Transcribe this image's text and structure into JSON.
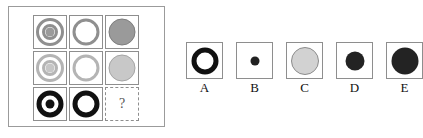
{
  "puzzle": {
    "type": "visual-analogy-matrix",
    "question_mark": "?",
    "matrix": {
      "rows": 3,
      "cols": 3,
      "cells": [
        {
          "id": "r1c1",
          "figure": "concentric-rings",
          "description": "gray concentric rings with gray center dot",
          "outer_ring_color": "#8f8f8f",
          "inner_ring_color": "#8f8f8f",
          "core_color": "#9a9a9a",
          "gap_color": "#ffffff",
          "outer_diameter": 28,
          "ring_thickness": 3,
          "inner_diameter": 16,
          "core_diameter": 9
        },
        {
          "id": "r1c2",
          "figure": "single-ring",
          "description": "gray open ring with white center",
          "ring_color": "#8f8f8f",
          "core_color": "#ffffff",
          "outer_diameter": 27,
          "ring_thickness": 3
        },
        {
          "id": "r1c3",
          "figure": "solid-disc",
          "description": "solid medium gray disc",
          "fill_color": "#9a9a9a",
          "stroke_color": "#7d7d7d",
          "diameter": 27
        },
        {
          "id": "r2c1",
          "figure": "concentric-rings",
          "description": "light gray concentric rings with light gray center dot",
          "outer_ring_color": "#b4b4b4",
          "inner_ring_color": "#b4b4b4",
          "core_color": "#c6c6c6",
          "gap_color": "#ffffff",
          "outer_diameter": 28,
          "ring_thickness": 3,
          "inner_diameter": 16,
          "core_diameter": 9
        },
        {
          "id": "r2c2",
          "figure": "single-ring",
          "description": "light gray open ring with white center",
          "ring_color": "#b4b4b4",
          "core_color": "#ffffff",
          "outer_diameter": 27,
          "ring_thickness": 3
        },
        {
          "id": "r2c3",
          "figure": "solid-disc",
          "description": "solid light gray disc",
          "fill_color": "#c8c8c8",
          "stroke_color": "#a5a5a5",
          "diameter": 27
        },
        {
          "id": "r3c1",
          "figure": "concentric-rings",
          "description": "thick black ring with white gap and black core",
          "outer_ring_color": "#111111",
          "inner_ring_color": "#111111",
          "core_color": "#111111",
          "gap_color": "#ffffff",
          "outer_diameter": 27,
          "ring_thickness": 5,
          "inner_diameter": 12,
          "core_diameter": 9
        },
        {
          "id": "r3c2",
          "figure": "single-ring",
          "description": "thick black open ring with white center",
          "ring_color": "#111111",
          "core_color": "#ffffff",
          "outer_diameter": 27,
          "ring_thickness": 5
        },
        {
          "id": "r3c3",
          "figure": "missing",
          "description": "dashed empty cell containing a question mark",
          "label": "?"
        }
      ]
    },
    "options": [
      {
        "label": "A",
        "figure": "thick-ring",
        "description": "thick black ring with white center",
        "ring_color": "#111111",
        "core_color": "#ffffff",
        "outer_diameter": 27,
        "ring_thickness": 5
      },
      {
        "label": "B",
        "figure": "small-disc",
        "description": "small solid black dot",
        "fill_color": "#222222",
        "diameter": 9
      },
      {
        "label": "C",
        "figure": "large-disc",
        "description": "large light gray disc with gray outline",
        "fill_color": "#d2d2d2",
        "stroke_color": "#8c8c8c",
        "diameter": 28
      },
      {
        "label": "D",
        "figure": "medium-disc",
        "description": "medium solid black disc",
        "fill_color": "#232323",
        "diameter": 19
      },
      {
        "label": "E",
        "figure": "large-disc",
        "description": "large solid black disc",
        "fill_color": "#232323",
        "diameter": 27
      }
    ]
  },
  "colors": {
    "panel_border": "#9b9b9b",
    "cell_border": "#8e8e8e",
    "background": "#ffffff",
    "text": "#111111",
    "qmark_text": "#555555"
  }
}
